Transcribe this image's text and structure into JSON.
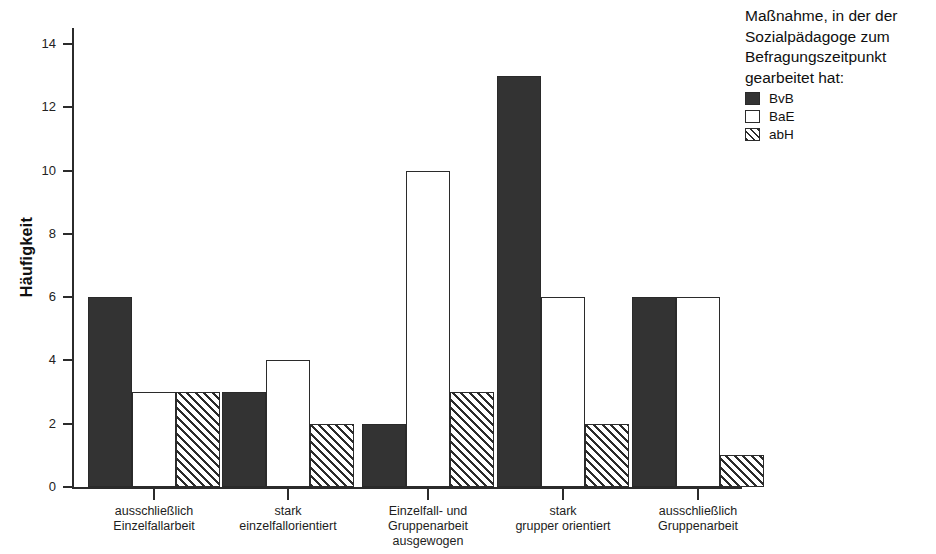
{
  "title_sliver": "Maßnahme und Arbeitsschwerpunkt des Sozialpädagogen",
  "legend": {
    "title": "Maßnahme, in der der Sozialpädagoge zum Befragungszeitpunkt gearbeitet hat:",
    "entries": [
      {
        "label": "BvB",
        "swatch": "solid-dark-swatch"
      },
      {
        "label": "BaE",
        "swatch": "white-outline-swatch"
      },
      {
        "label": "abH",
        "swatch": "diagonal-hatch-swatch"
      }
    ]
  },
  "chart_data": {
    "type": "bar",
    "title": "",
    "xlabel": "",
    "ylabel": "Häufigkeit",
    "ylim": [
      0,
      15
    ],
    "yticks": [
      0,
      2,
      4,
      6,
      8,
      10,
      12,
      14
    ],
    "ytick_labels": [
      "0",
      "2",
      "4",
      "6",
      "8",
      "10",
      "12",
      "14"
    ],
    "grid": false,
    "legend_position": "top-right",
    "categories": [
      "ausschließlich\nEinzelfallarbeit",
      "stark\neinzelfallorientiert",
      "Einzelfall- und\nGruppenarbeit\nausgewogen",
      "stark\ngrupper orientiert",
      "ausschließlich\nGruppenarbeit"
    ],
    "category_lines": [
      [
        "ausschließlich",
        "Einzelfallarbeit"
      ],
      [
        "stark",
        "einzelfallorientiert"
      ],
      [
        "Einzelfall- und",
        "Gruppenarbeit",
        "ausgewogen"
      ],
      [
        "stark",
        "grupper orientiert"
      ],
      [
        "ausschließlich",
        "Gruppenarbeit"
      ]
    ],
    "series": [
      {
        "name": "BvB",
        "fill": "solid",
        "color": "#333333",
        "values": [
          6,
          3,
          2,
          13,
          6
        ]
      },
      {
        "name": "BaE",
        "fill": "empty",
        "color": "#ffffff",
        "values": [
          3,
          4,
          10,
          6,
          6
        ]
      },
      {
        "name": "abH",
        "fill": "hatched",
        "color": "#2b2b2b",
        "values": [
          3,
          2,
          3,
          2,
          1
        ]
      }
    ]
  }
}
